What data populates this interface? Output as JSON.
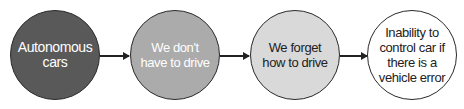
{
  "diagram": {
    "type": "flow",
    "nodes": [
      {
        "label": "Autonomous cars",
        "fill": "#595959",
        "text_color": "#ffffff"
      },
      {
        "label": "We don't have to drive",
        "fill": "#ababab",
        "text_color": "#ffffff"
      },
      {
        "label": "We forget how to drive",
        "fill": "#d9d9d9",
        "text_color": "#222222"
      },
      {
        "label": "Inability to control car if there is a vehicle error",
        "fill": "#ffffff",
        "text_color": "#222222"
      }
    ],
    "edges": [
      {
        "from": 0,
        "to": 1
      },
      {
        "from": 1,
        "to": 2
      },
      {
        "from": 2,
        "to": 3
      }
    ]
  }
}
